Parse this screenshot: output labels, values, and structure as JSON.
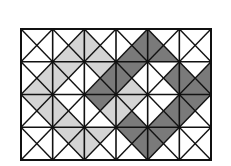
{
  "diagram": {
    "type": "triangle-tiling-grid",
    "rows": 4,
    "cols": 6,
    "cell_order": [
      "top",
      "right",
      "bottom",
      "left"
    ],
    "legend_shades": {
      "0": "white",
      "1": "light-gray",
      "2": "dark-gray"
    },
    "colors": {
      "0": "#ffffff",
      "1": "#d4d4d4",
      "2": "#7a7a7a",
      "line": "#111111"
    },
    "cells": [
      [
        [
          0,
          0,
          0,
          0
        ],
        [
          0,
          1,
          1,
          0
        ],
        [
          0,
          0,
          1,
          1
        ],
        [
          0,
          2,
          2,
          0
        ],
        [
          0,
          0,
          2,
          2
        ],
        [
          0,
          0,
          0,
          0
        ]
      ],
      [
        [
          0,
          1,
          1,
          0
        ],
        [
          1,
          0,
          0,
          1
        ],
        [
          1,
          2,
          2,
          0
        ],
        [
          2,
          0,
          1,
          2
        ],
        [
          0,
          2,
          0,
          0
        ],
        [
          0,
          2,
          2,
          2
        ]
      ],
      [
        [
          1,
          1,
          0,
          0
        ],
        [
          0,
          0,
          1,
          1
        ],
        [
          2,
          1,
          0,
          0
        ],
        [
          1,
          0,
          2,
          1
        ],
        [
          0,
          2,
          2,
          0
        ],
        [
          2,
          0,
          0,
          2
        ]
      ],
      [
        [
          0,
          0,
          0,
          0
        ],
        [
          1,
          1,
          0,
          0
        ],
        [
          1,
          0,
          0,
          1
        ],
        [
          2,
          2,
          0,
          0
        ],
        [
          2,
          0,
          0,
          2
        ],
        [
          0,
          0,
          0,
          0
        ]
      ]
    ]
  }
}
